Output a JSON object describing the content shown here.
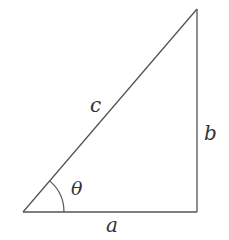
{
  "diagram": {
    "type": "right-triangle",
    "stroke_color": "#555555",
    "label_color": "#333333",
    "vertices": {
      "bottom_left": [
        23,
        212
      ],
      "bottom_right": [
        197,
        212
      ],
      "top_right": [
        197,
        9
      ]
    },
    "angle_arc_radius": 41,
    "labels": {
      "hypotenuse": "c",
      "vertical_side": "b",
      "horizontal_side": "a",
      "angle": "θ"
    }
  }
}
